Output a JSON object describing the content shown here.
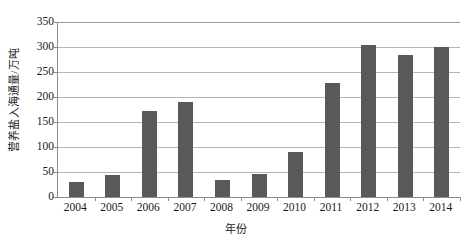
{
  "chart_data": {
    "type": "bar",
    "title": "",
    "xlabel": "年份",
    "ylabel": "营养盐入海通量/万吨",
    "categories": [
      "2004",
      "2005",
      "2006",
      "2007",
      "2008",
      "2009",
      "2010",
      "2011",
      "2012",
      "2013",
      "2014"
    ],
    "values": [
      31,
      45,
      173,
      190,
      34,
      47,
      90,
      228,
      304,
      284,
      301
    ],
    "ylim": [
      0,
      350
    ],
    "yticks": [
      0,
      50,
      100,
      150,
      200,
      250,
      300,
      350
    ],
    "ytick_labels": [
      "0",
      "50",
      "100",
      "150",
      "200",
      "250",
      "300",
      "350"
    ],
    "grid": "horizontal",
    "legend": "none",
    "bar_color": "#595959",
    "gridline_color": "#b5b5b5",
    "axis_color": "#8c8c8c"
  }
}
